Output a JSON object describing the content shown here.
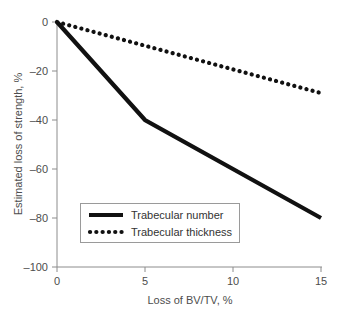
{
  "chart_data": {
    "type": "line",
    "title": "",
    "xlabel": "Loss of BV/TV, %",
    "ylabel": "Estimated loss of strength, %",
    "xlim": [
      0,
      15
    ],
    "ylim": [
      -100,
      0
    ],
    "xticks": [
      "0",
      "5",
      "10",
      "15"
    ],
    "xtick_values": [
      0,
      5,
      10,
      15
    ],
    "yticks": [
      "0",
      "–20",
      "–40",
      "–60",
      "–80",
      "–100"
    ],
    "ytick_values": [
      0,
      -20,
      -40,
      -60,
      -80,
      -100
    ],
    "grid": false,
    "legend_position": "lower-left-inside",
    "series": [
      {
        "name": "Trabecular number",
        "style": "solid",
        "color": "#111111",
        "x": [
          0,
          5,
          15
        ],
        "values": [
          0,
          -40,
          -80
        ]
      },
      {
        "name": "Trabecular thickness",
        "style": "dotted",
        "color": "#111111",
        "x": [
          0,
          15
        ],
        "values": [
          0,
          -29
        ]
      }
    ]
  },
  "legend": {
    "items": [
      {
        "label": "Trabecular number",
        "style": "solid"
      },
      {
        "label": "Trabecular thickness",
        "style": "dotted"
      }
    ]
  }
}
